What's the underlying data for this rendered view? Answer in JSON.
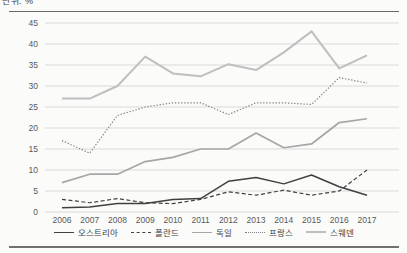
{
  "document": {
    "cropped_top_text": "단위: %",
    "rule_color": "#4f4f4f"
  },
  "chart_data": {
    "type": "line",
    "title": "",
    "xlabel": "",
    "ylabel": "",
    "x": [
      2006,
      2007,
      2008,
      2009,
      2010,
      2011,
      2012,
      2013,
      2014,
      2015,
      2016,
      2017
    ],
    "ylim": [
      0,
      45
    ],
    "yticks": [
      0,
      5,
      10,
      15,
      20,
      25,
      30,
      35,
      40,
      45
    ],
    "grid": "horizontal",
    "gridline_color": "#d9d9d9",
    "tick_label_color": "#595959",
    "legend_position": "bottom",
    "series": [
      {
        "key": "austria",
        "name": "오스트리아",
        "line_style": "solid",
        "color": "#404040",
        "stroke_width": 1.5,
        "values": [
          1,
          1.2,
          2,
          2,
          3,
          3.2,
          7.3,
          8.2,
          6.7,
          8.8,
          6,
          4
        ]
      },
      {
        "key": "poland",
        "name": "폴란드",
        "line_style": "dashed",
        "color": "#404040",
        "stroke_width": 1.2,
        "values": [
          3,
          2.2,
          3.2,
          2.2,
          2,
          3,
          4.8,
          4,
          5.2,
          4,
          5,
          10
        ]
      },
      {
        "key": "germany",
        "name": "독일",
        "line_style": "solid",
        "color": "#a6a6a6",
        "stroke_width": 1.7,
        "values": [
          7,
          9,
          9,
          12,
          13,
          15,
          15,
          18.8,
          15.3,
          16.2,
          21.3,
          22.2
        ]
      },
      {
        "key": "france",
        "name": "프랑스",
        "line_style": "dotted",
        "color": "#7f7f7f",
        "stroke_width": 1.2,
        "values": [
          17,
          14,
          23,
          25,
          26,
          26,
          23.2,
          26,
          26,
          25.6,
          32,
          30.7
        ]
      },
      {
        "key": "sweden",
        "name": "스웨덴",
        "line_style": "solid",
        "color": "#bfbfbf",
        "stroke_width": 2,
        "values": [
          27,
          27,
          30,
          37,
          33,
          32.3,
          35.2,
          33.8,
          38,
          43,
          34.2,
          37.3
        ]
      }
    ]
  }
}
